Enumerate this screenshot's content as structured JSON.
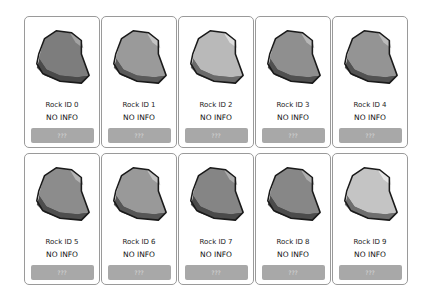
{
  "rocks": [
    {
      "label": "Rock ID 0",
      "info": "NO INFO",
      "button": "???",
      "base": "#7d7d7d",
      "light": "#a3a3a3",
      "dark": "#4a4a4a"
    },
    {
      "label": "Rock ID 1",
      "info": "NO INFO",
      "button": "???",
      "base": "#9a9a9a",
      "light": "#c4c4c4",
      "dark": "#5a5a5a"
    },
    {
      "label": "Rock ID 2",
      "info": "NO INFO",
      "button": "???",
      "base": "#b9b9b9",
      "light": "#dedede",
      "dark": "#6a6a6a"
    },
    {
      "label": "Rock ID 3",
      "info": "NO INFO",
      "button": "???",
      "base": "#8f8f8f",
      "light": "#b8b8b8",
      "dark": "#505050"
    },
    {
      "label": "Rock ID 4",
      "info": "NO INFO",
      "button": "???",
      "base": "#949494",
      "light": "#bcbcbc",
      "dark": "#525252"
    },
    {
      "label": "Rock ID 5",
      "info": "NO INFO",
      "button": "???",
      "base": "#8c8c8c",
      "light": "#b5b5b5",
      "dark": "#4e4e4e"
    },
    {
      "label": "Rock ID 6",
      "info": "NO INFO",
      "button": "???",
      "base": "#999999",
      "light": "#c1c1c1",
      "dark": "#565656"
    },
    {
      "label": "Rock ID 7",
      "info": "NO INFO",
      "button": "???",
      "base": "#858585",
      "light": "#acacac",
      "dark": "#4a4a4a"
    },
    {
      "label": "Rock ID 8",
      "info": "NO INFO",
      "button": "???",
      "base": "#878787",
      "light": "#afafaf",
      "dark": "#4c4c4c"
    },
    {
      "label": "Rock ID 9",
      "info": "NO INFO",
      "button": "???",
      "base": "#c4c4c4",
      "light": "#e6e6e6",
      "dark": "#6e6e6e"
    }
  ]
}
